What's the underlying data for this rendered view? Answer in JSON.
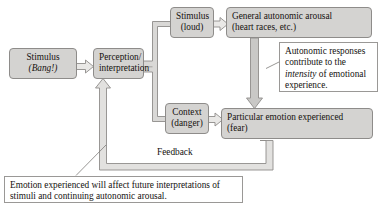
{
  "diagram": {
    "colors": {
      "node_fill": "#d4d3d1",
      "node_border": "#8e8c8a",
      "callout_fill": "#ffffff",
      "callout_border": "#9a9896",
      "connector_fill": "#c9c8c6",
      "connector_border": "#8e8c8a",
      "background": "#ffffff",
      "text": "#14110f"
    },
    "nodes": [
      {
        "id": "stimulus-bang",
        "line1": "Stimulus",
        "line2": "(Bang!)",
        "line2_italic": true,
        "align": "center"
      },
      {
        "id": "perception-interpretation",
        "line1": "Perception/",
        "line2": "interpretation",
        "line2_italic": false,
        "align": "center"
      },
      {
        "id": "stimulus-loud",
        "line1": "Stimulus",
        "line2": "(loud)",
        "line2_italic": false,
        "align": "center"
      },
      {
        "id": "context-danger",
        "line1": "Context",
        "line2": "(danger)",
        "line2_italic": false,
        "align": "center"
      },
      {
        "id": "general-arousal",
        "line1": "General autonomic arousal",
        "line2": "(heart races, etc.)",
        "line2_italic": false,
        "align": "left"
      },
      {
        "id": "particular-emotion",
        "line1": "Particular emotion experienced",
        "line2": "(fear)",
        "line2_italic": false,
        "align": "left"
      }
    ],
    "edge_labels": [
      {
        "id": "feedback",
        "text": "Feedback"
      }
    ],
    "callouts": [
      {
        "id": "intensity-callout",
        "segments": [
          {
            "text": "Autonomic responses contribute to the ",
            "italic": false
          },
          {
            "text": "intensity",
            "italic": true
          },
          {
            "text": " of emotional experience.",
            "italic": false
          }
        ]
      },
      {
        "id": "feedback-callout",
        "segments": [
          {
            "text": "Emotion experienced will affect future interpretations of stimuli and continuing autonomic arousal.",
            "italic": false
          }
        ]
      }
    ]
  }
}
